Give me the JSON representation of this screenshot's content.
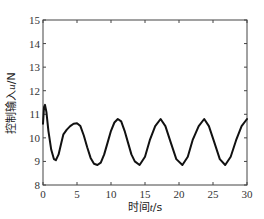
{
  "chart_data": {
    "type": "line",
    "title": "",
    "xlabel": "时间t/s",
    "ylabel": "控制输入u/N",
    "xlabel_parts": {
      "prefix": "时间",
      "var": "t",
      "unit": "/s"
    },
    "ylabel_parts": {
      "prefix": "控制输入",
      "var": "u",
      "unit": "/N"
    },
    "xlim": [
      0,
      30
    ],
    "ylim": [
      8,
      15
    ],
    "xticks": [
      0,
      5,
      10,
      15,
      20,
      25,
      30
    ],
    "yticks": [
      8,
      9,
      10,
      11,
      12,
      13,
      14,
      15
    ],
    "grid": false,
    "legend": null,
    "line_color": "#111111",
    "series": [
      {
        "name": "u",
        "x": [
          0,
          0.15,
          0.3,
          0.5,
          0.8,
          1.2,
          1.6,
          1.9,
          2.3,
          2.7,
          3.0,
          3.5,
          4.0,
          4.5,
          5.0,
          5.5,
          6.0,
          6.5,
          7.0,
          7.5,
          8.0,
          8.5,
          9.0,
          9.5,
          10.0,
          10.5,
          11.0,
          11.5,
          12.0,
          12.5,
          13.0,
          13.5,
          14.2,
          15.0,
          15.7,
          16.5,
          17.3,
          18.0,
          18.8,
          19.6,
          20.5,
          21.3,
          22.0,
          22.9,
          23.7,
          24.4,
          25.2,
          26.0,
          26.8,
          27.6,
          28.4,
          29.2,
          30.0
        ],
        "values": [
          10.6,
          11.3,
          11.4,
          11.1,
          10.3,
          9.5,
          9.1,
          9.05,
          9.3,
          9.8,
          10.15,
          10.35,
          10.5,
          10.6,
          10.62,
          10.5,
          10.1,
          9.6,
          9.15,
          8.9,
          8.85,
          8.95,
          9.3,
          9.8,
          10.3,
          10.65,
          10.8,
          10.7,
          10.3,
          9.8,
          9.3,
          9.0,
          8.85,
          9.2,
          9.9,
          10.5,
          10.8,
          10.5,
          9.8,
          9.1,
          8.85,
          9.2,
          9.9,
          10.5,
          10.8,
          10.5,
          9.8,
          9.1,
          8.85,
          9.2,
          9.9,
          10.5,
          10.8
        ]
      }
    ]
  }
}
